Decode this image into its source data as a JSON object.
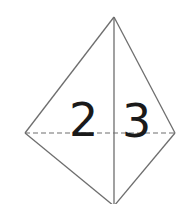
{
  "diagram": {
    "type": "net-of-solid",
    "vertices": {
      "top": [
        114,
        17
      ],
      "left": [
        25,
        133
      ],
      "right": [
        175,
        133
      ],
      "bottom": [
        114,
        206
      ]
    },
    "edges": {
      "solid": [
        [
          "top",
          "left"
        ],
        [
          "top",
          "right"
        ],
        [
          "left",
          "bottom"
        ],
        [
          "right",
          "bottom"
        ],
        [
          "top",
          "bottom"
        ]
      ],
      "dashed": [
        [
          "left",
          "right"
        ]
      ]
    },
    "labels": [
      {
        "text": "2",
        "x": 69,
        "y": 136
      },
      {
        "text": "3",
        "x": 122,
        "y": 137
      }
    ],
    "colors": {
      "line": "#6e6e6e",
      "label": "#1a1a1a",
      "background": "#ffffff"
    }
  }
}
